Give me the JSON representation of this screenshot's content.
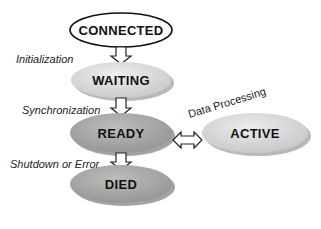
{
  "diagram": {
    "type": "state-transition",
    "states": [
      {
        "id": "connected",
        "label": "CONNECTED",
        "fill": "#ffffff"
      },
      {
        "id": "waiting",
        "label": "WAITING",
        "fill": "#dcdcdc"
      },
      {
        "id": "ready",
        "label": "READY",
        "fill": "#a8a8a8"
      },
      {
        "id": "active",
        "label": "ACTIVE",
        "fill": "#d8d8d8"
      },
      {
        "id": "died",
        "label": "DIED",
        "fill": "#a8a8a8"
      }
    ],
    "transitions": [
      {
        "from": "connected",
        "to": "waiting",
        "label": "Initialization"
      },
      {
        "from": "waiting",
        "to": "ready",
        "label": "Synchronization"
      },
      {
        "from": "ready",
        "to": "active",
        "label": "Data Processing",
        "bidirectional": true
      },
      {
        "from": "ready",
        "to": "died",
        "label": "Shutdown or Error"
      }
    ]
  }
}
